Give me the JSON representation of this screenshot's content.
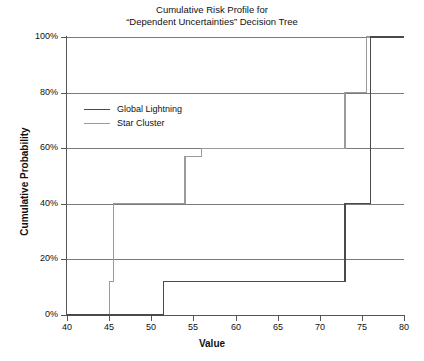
{
  "chart_data": {
    "type": "line",
    "title_lines": [
      "Cumulative Risk Profile for",
      "“Dependent Uncertainties” Decision Tree"
    ],
    "xlabel": "Value",
    "ylabel": "Cumulative Probability",
    "xlim": [
      40,
      80
    ],
    "ylim": [
      0,
      100
    ],
    "xticks": [
      40,
      45,
      50,
      55,
      60,
      65,
      70,
      75,
      80
    ],
    "xticklabels": [
      "40",
      "45",
      "50",
      "55",
      "60",
      "65",
      "70",
      "75",
      "80"
    ],
    "yticks": [
      0,
      20,
      40,
      60,
      80,
      100
    ],
    "yticklabels": [
      "0%",
      "20%",
      "40%",
      "60%",
      "80%",
      "100%"
    ],
    "grid": true,
    "grid_axis": "y",
    "legend_position": "upper left inside",
    "step_style": "post",
    "series": [
      {
        "name": "Global Lightning",
        "color": "#4a4a4a",
        "points_x": [
          40,
          51.5,
          51.5,
          73,
          73,
          76,
          76,
          80
        ],
        "points_y": [
          0,
          0,
          12,
          12,
          40,
          40,
          57,
          57
        ]
      },
      {
        "name": "Star Cluster",
        "color": "#9a9a9a",
        "points_x": [
          40,
          45,
          45,
          45.5,
          45.5,
          54,
          54,
          56,
          56,
          75.5,
          75.5,
          80
        ],
        "points_y": [
          0,
          0,
          12,
          12,
          40,
          40,
          60,
          60,
          100,
          100,
          100,
          100
        ]
      }
    ],
    "series_paths": {
      "global_lightning": "M 40,0 L 51.5,0 L 51.5,12 L 73,12 L 73,40 L 76,40 L 76,100 L 80,100",
      "star_cluster": "M 40,0 L 45,0 L 45,12 L 45.5,12 L 45.5,40 L 54,40 L 54,57 L 56,57 L 56,60 L 73,60 L 73,80 L 75.5,80 L 75.5,100 L 80,100"
    }
  },
  "legend": {
    "entries": [
      {
        "label": "Global Lightning",
        "color": "#4a4a4a"
      },
      {
        "label": "Star Cluster",
        "color": "#9a9a9a"
      }
    ]
  }
}
